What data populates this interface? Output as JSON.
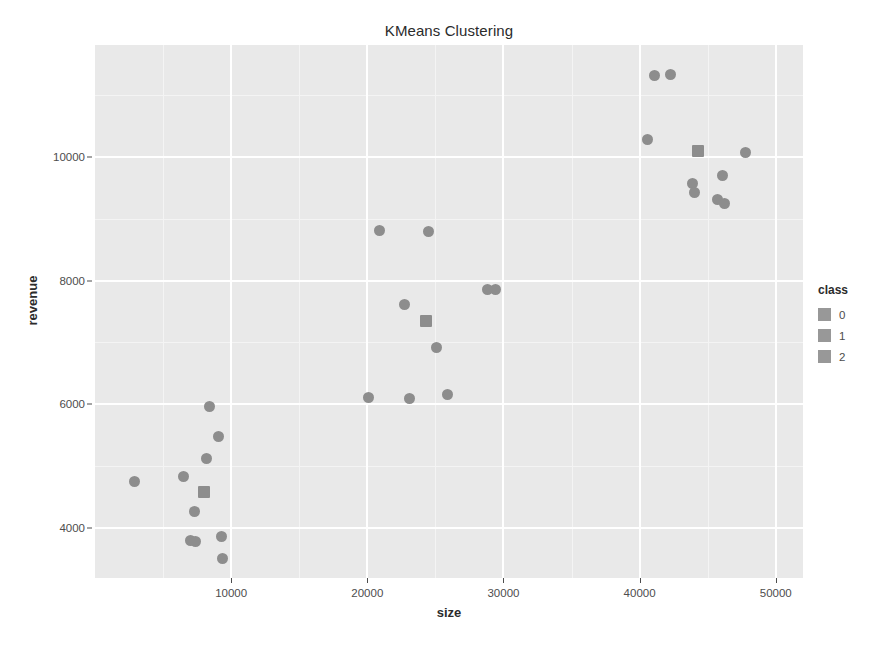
{
  "chart_data": {
    "type": "scatter",
    "title": "KMeans Clustering",
    "xlabel": "size",
    "ylabel": "revenue",
    "xlim": [
      0,
      52000
    ],
    "ylim": [
      3200,
      11800
    ],
    "xticks": [
      10000,
      20000,
      30000,
      40000,
      50000
    ],
    "yticks": [
      4000,
      6000,
      8000,
      10000
    ],
    "xtick_labels": [
      "10000",
      "20000",
      "30000",
      "40000",
      "50000"
    ],
    "ytick_labels": [
      "4000",
      "6000",
      "8000",
      "10000"
    ],
    "grid": true,
    "legend": {
      "title": "class",
      "position": "right",
      "entries": [
        {
          "label": "0",
          "color": "#989898"
        },
        {
          "label": "1",
          "color": "#989898"
        },
        {
          "label": "2",
          "color": "#989898"
        }
      ]
    },
    "panel_background": "#e9e9e9",
    "point_color": "#8d8d8d",
    "series": [
      {
        "name": "0",
        "marker": "circle",
        "points": [
          {
            "x": 2900,
            "y": 4760
          },
          {
            "x": 6500,
            "y": 4830
          },
          {
            "x": 7000,
            "y": 3810
          },
          {
            "x": 7400,
            "y": 3790
          },
          {
            "x": 7300,
            "y": 4270
          },
          {
            "x": 8200,
            "y": 5130
          },
          {
            "x": 8400,
            "y": 5970
          },
          {
            "x": 9100,
            "y": 5490
          },
          {
            "x": 9300,
            "y": 3870
          },
          {
            "x": 9400,
            "y": 3510
          }
        ]
      },
      {
        "name": "1",
        "marker": "circle",
        "points": [
          {
            "x": 20100,
            "y": 6120
          },
          {
            "x": 20900,
            "y": 8800
          },
          {
            "x": 22700,
            "y": 7610
          },
          {
            "x": 23100,
            "y": 6100
          },
          {
            "x": 24500,
            "y": 8790
          },
          {
            "x": 25100,
            "y": 6920
          },
          {
            "x": 25900,
            "y": 6160
          },
          {
            "x": 28800,
            "y": 7850
          },
          {
            "x": 29400,
            "y": 7860
          }
        ]
      },
      {
        "name": "2",
        "marker": "circle",
        "points": [
          {
            "x": 40600,
            "y": 10280
          },
          {
            "x": 41100,
            "y": 11300
          },
          {
            "x": 42300,
            "y": 11320
          },
          {
            "x": 43900,
            "y": 9560
          },
          {
            "x": 44000,
            "y": 9420
          },
          {
            "x": 45700,
            "y": 9310
          },
          {
            "x": 46200,
            "y": 9240
          },
          {
            "x": 46100,
            "y": 9690
          },
          {
            "x": 47800,
            "y": 10060
          }
        ]
      }
    ],
    "centroids": [
      {
        "class": "0",
        "x": 8000,
        "y": 4590,
        "marker": "square"
      },
      {
        "class": "1",
        "x": 24300,
        "y": 7350,
        "marker": "square"
      },
      {
        "class": "2",
        "x": 44300,
        "y": 10090,
        "marker": "square"
      }
    ]
  }
}
